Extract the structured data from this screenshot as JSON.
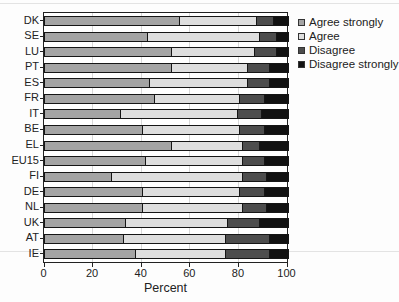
{
  "chart_data": {
    "type": "bar",
    "orientation": "horizontal-stacked",
    "title": "",
    "xlabel": "Percent",
    "ylabel": "",
    "xlim": [
      0,
      100
    ],
    "xticks": [
      0,
      20,
      40,
      60,
      80,
      100
    ],
    "grid": true,
    "legend_position": "top-right",
    "categories": [
      "DK",
      "SE",
      "LU",
      "PT",
      "ES",
      "FR",
      "IT",
      "BE",
      "EL",
      "EU15",
      "FI",
      "DE",
      "NL",
      "UK",
      "AT",
      "IE"
    ],
    "series": [
      {
        "name": "Agree strongly",
        "color": "#a4a4a4",
        "values": [
          55,
          42,
          52,
          52,
          43,
          45,
          31,
          40,
          52,
          41,
          27,
          40,
          40,
          33,
          32,
          37
        ]
      },
      {
        "name": "Agree",
        "color": "#dedede",
        "values": [
          32,
          46,
          34,
          31,
          40,
          35,
          48,
          40,
          29,
          40,
          54,
          40,
          41,
          42,
          42,
          37
        ]
      },
      {
        "name": "Disagree",
        "color": "#4d4d4d",
        "values": [
          7,
          7,
          9,
          9,
          9,
          10,
          10,
          10,
          7,
          9,
          10,
          10,
          10,
          13,
          18,
          18
        ]
      },
      {
        "name": "Disagree strongly",
        "color": "#121212",
        "values": [
          6,
          5,
          5,
          8,
          8,
          10,
          11,
          10,
          12,
          10,
          9,
          10,
          9,
          12,
          8,
          8
        ]
      }
    ],
    "colors": {
      "frame": "#222222",
      "gridline": "#d8d8d8",
      "text": "#222222"
    }
  }
}
